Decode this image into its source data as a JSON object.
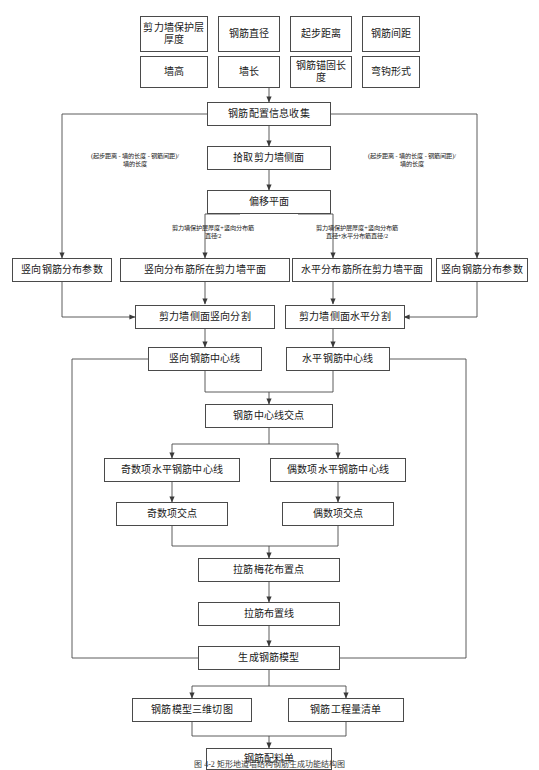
{
  "figure": {
    "caption": "图 4-2  矩形地道墙结构钢筋生成功能结构图"
  },
  "inputs": {
    "row1": [
      {
        "label": "剪力墙保护层厚度"
      },
      {
        "label": "钢筋直径"
      },
      {
        "label": "起步距离"
      },
      {
        "label": "钢筋间距"
      }
    ],
    "row2": [
      {
        "label": "墙高"
      },
      {
        "label": "墙长"
      },
      {
        "label": "钢筋锚固长度"
      },
      {
        "label": "弯钩形式"
      }
    ]
  },
  "nodes": {
    "collect": "钢筋配置信息收集",
    "pick_side": "拾取剪力墙侧面",
    "offset_plane": "偏移平面",
    "vert_param_left": "竖向钢筋分布参数",
    "vert_plane": "竖向分布筋所在剪力墙平面",
    "horiz_plane": "水平分布筋所在剪力墙平面",
    "vert_param_right": "竖向钢筋分布参数",
    "vert_split": "剪力墙侧面竖向分割",
    "horiz_split": "剪力墙侧面水平分割",
    "vert_centerline": "竖向钢筋中心线",
    "horiz_centerline": "水平钢筋中心线",
    "centerline_cross": "钢筋中心线交点",
    "odd_horiz_centerline": "奇数项水平钢筋中心线",
    "even_horiz_centerline": "偶数项水平钢筋中心线",
    "odd_cross": "奇数项交点",
    "even_cross": "偶数项交点",
    "plum_points": "拉筋梅花布置点",
    "tie_lines": "拉筋布置线",
    "generate_model": "生成钢筋模型",
    "model_3d_cut": "钢筋模型三维切图",
    "quantity_list": "钢筋工程量清单",
    "material_sheet": "钢筋配料单"
  },
  "annotations": {
    "left_spacing": "(起步距离 - 墙的长度 - 钢筋间距)/\n墙的长度",
    "right_spacing": "(起步距离 - 墙的长度 - 钢筋间距)/\n墙的长度",
    "vert_offset": "剪力墙保护层厚度+竖向分布筋\n直径/2",
    "horiz_offset": "剪力墙保护层厚度+竖向分布筋\n直径+水平分布筋直径/2"
  },
  "style": {
    "line_color": "#4a4a4a",
    "text_color": "#1a1a1a",
    "background": "#ffffff"
  }
}
